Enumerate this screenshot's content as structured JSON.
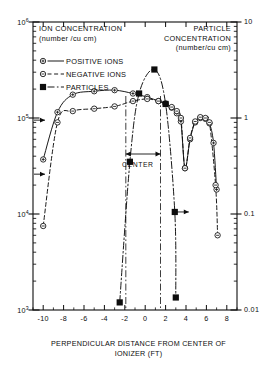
{
  "chart_data": {
    "type": "line",
    "title": "",
    "xlabel": "PERPENDICULAR DISTANCE FROM CENTER OF IONIZER (FT)",
    "ylabel_left_line1": "ION CONCENTRATION",
    "ylabel_left_line2": "(number /cu cm)",
    "ylabel_right_line1": "PARTICLE",
    "ylabel_right_line2": "CONCENTRATION",
    "ylabel_right_line3": "(number/cu cm)",
    "xlim": [
      -11,
      9
    ],
    "xticks": [
      "-10",
      "-8",
      "-6",
      "-4",
      "-2",
      "0",
      "2",
      "4",
      "6",
      "8"
    ],
    "xtick_values": [
      -10,
      -8,
      -6,
      -4,
      -2,
      0,
      2,
      4,
      6,
      8
    ],
    "yscale": "log",
    "ylim_left": [
      1000,
      1000000
    ],
    "yticks_left": [
      "10",
      "10",
      "10",
      "10"
    ],
    "yticks_left_exp": [
      "6",
      "5",
      "4",
      "3"
    ],
    "ytick_left_values": [
      1000000,
      100000,
      10000,
      1000
    ],
    "ylim_right": [
      0.01,
      10
    ],
    "yticks_right": [
      "10",
      "1",
      "0.1",
      "0.01"
    ],
    "ytick_right_values": [
      10,
      1,
      0.1,
      0.01
    ],
    "grid": false,
    "legend_position": "upper-left",
    "series": [
      {
        "name": "POSITIVE IONS",
        "axis": "left",
        "marker": "circle-plus",
        "linestyle": "solid",
        "points": [
          [
            -10,
            37000
          ],
          [
            -8.6,
            115000
          ],
          [
            -7.1,
            175000
          ],
          [
            -5.0,
            190000
          ],
          [
            -3.0,
            195000
          ],
          [
            -1.2,
            180000
          ],
          [
            0.2,
            165000
          ],
          [
            1.3,
            150000
          ],
          [
            2.0,
            140000
          ],
          [
            2.6,
            128000
          ],
          [
            3.1,
            112000
          ],
          [
            3.5,
            92000
          ],
          [
            3.9,
            30000
          ],
          [
            4.4,
            60000
          ],
          [
            4.9,
            90000
          ],
          [
            5.4,
            100000
          ],
          [
            5.9,
            98000
          ],
          [
            6.3,
            88000
          ],
          [
            6.7,
            55000
          ],
          [
            7.0,
            18000
          ]
        ]
      },
      {
        "name": "NEGATIVE IONS",
        "axis": "left",
        "marker": "circle-minus",
        "linestyle": "dashed",
        "points": [
          [
            -10,
            7500
          ],
          [
            -8.6,
            90000
          ],
          [
            -7.1,
            118000
          ],
          [
            -5.0,
            125000
          ],
          [
            -3.0,
            132000
          ],
          [
            -1.2,
            150000
          ],
          [
            0.2,
            158000
          ],
          [
            1.3,
            150000
          ],
          [
            2.0,
            142000
          ],
          [
            2.6,
            130000
          ],
          [
            3.1,
            118000
          ],
          [
            3.5,
            100000
          ],
          [
            3.9,
            30000
          ],
          [
            4.4,
            62000
          ],
          [
            4.9,
            92000
          ],
          [
            5.4,
            102000
          ],
          [
            5.9,
            100000
          ],
          [
            6.3,
            90000
          ],
          [
            6.9,
            20000
          ],
          [
            7.1,
            6000
          ]
        ]
      },
      {
        "name": "PARTICLES",
        "axis": "right",
        "marker": "filled-square",
        "linestyle": "dashdot",
        "points": [
          [
            -2.5,
            0.012
          ],
          [
            -1.5,
            0.35
          ],
          [
            -0.6,
            1.8
          ],
          [
            0.9,
            3.2
          ],
          [
            2.0,
            1.4
          ],
          [
            2.9,
            0.105
          ],
          [
            3.0,
            0.0135
          ]
        ]
      }
    ],
    "annotations": [
      {
        "name": "center-span",
        "label": "CENTER",
        "x_from": -1.9,
        "x_to": 1.5
      },
      {
        "name": "left-axis-arrow-upper",
        "value": 95000
      },
      {
        "name": "left-axis-arrow-lower",
        "value": 26000
      },
      {
        "name": "particle-arrow",
        "value": 0.105
      }
    ]
  },
  "legend": {
    "items": [
      {
        "label": "POSITIVE IONS",
        "marker": "circle-plus",
        "line": "solid"
      },
      {
        "label": "NEGATIVE IONS",
        "marker": "circle-minus",
        "line": "dashed"
      },
      {
        "label": "PARTICLES",
        "marker": "filled-square",
        "line": "dashdot"
      }
    ]
  },
  "colors": {
    "ink": "#0d0d0d",
    "paper": "#ffffff"
  }
}
